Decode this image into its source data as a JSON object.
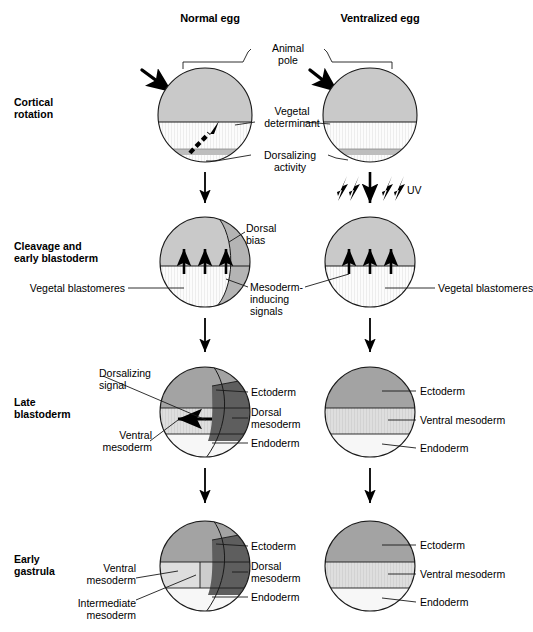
{
  "figure": {
    "title_columns": [
      {
        "label": "Normal egg"
      },
      {
        "label": "Ventralized egg"
      }
    ],
    "stages": [
      {
        "id": "cortical-rotation",
        "label_line1": "Cortical",
        "label_line2": "rotation"
      },
      {
        "id": "cleavage-early-blastoderm",
        "label_line1": "Cleavage and",
        "label_line2": "early blastoderm"
      },
      {
        "id": "late-blastoderm",
        "label_line1": "Late",
        "label_line2": "blastoderm"
      },
      {
        "id": "early-gastrula",
        "label_line1": "Early",
        "label_line2": "gastrula"
      }
    ],
    "annotations": {
      "animal_pole_line1": "Animal",
      "animal_pole_line2": "pole",
      "vegetal_determinant_line1": "Vegetal",
      "vegetal_determinant_line2": "determinant",
      "dorsalizing_activity_line1": "Dorsalizing",
      "dorsalizing_activity_line2": "activity",
      "uv": "UV",
      "dorsal_bias_line1": "Dorsal",
      "dorsal_bias_line2": "bias",
      "mesoderm_inducing_line1": "Mesoderm-",
      "mesoderm_inducing_line2": "inducing",
      "mesoderm_inducing_line3": "signals",
      "vegetal_blastomeres_left": "Vegetal blastomeres",
      "vegetal_blastomeres_right": "Vegetal blastomeres",
      "dorsalizing_signal_line1": "Dorsalizing",
      "dorsalizing_signal_line2": "signal",
      "ectoderm": "Ectoderm",
      "dorsal_mesoderm_line1": "Dorsal",
      "dorsal_mesoderm_line2": "mesoderm",
      "endoderm": "Endoderm",
      "ventral_mesoderm_line1": "Ventral",
      "ventral_mesoderm_line2": "mesoderm",
      "ventral_mesoderm_inline": "Ventral mesoderm",
      "intermediate_mesoderm_line1": "Intermediate",
      "intermediate_mesoderm_line2": "mesoderm"
    },
    "colors": {
      "animal_cytoplasm": "#c9c9c9",
      "vegetal_cytoplasm": "#fbfbfb",
      "dorsalizing_band": "#bdbdbd",
      "dorsal_bias": "#b4b4b4",
      "ectoderm": "#a3a3a3",
      "dorsal_mesoderm": "#5e5e5e",
      "ventral_mesoderm": "#d9d9d9",
      "intermediate_mesoderm": "#cdcdcd",
      "endoderm": "#f7f7f7",
      "outline": "#1a1a1a",
      "background": "#ffffff"
    }
  }
}
